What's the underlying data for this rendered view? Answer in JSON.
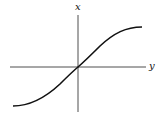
{
  "diagram": {
    "type": "function-plot",
    "axes": {
      "vertical_label": "x",
      "horizontal_label": "y"
    },
    "curve": {
      "shape": "sigmoid",
      "description": "S-shaped curve passing through the origin, increasing, saturating at both ends"
    },
    "colors": {
      "stroke": "#111111",
      "background": "#ffffff"
    }
  }
}
